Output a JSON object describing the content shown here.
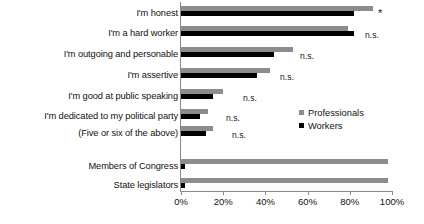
{
  "chart_data": {
    "type": "bar",
    "orientation": "horizontal",
    "title": "",
    "xlabel": "",
    "ylabel": "",
    "xlim": [
      0,
      100
    ],
    "xticks": [
      "0%",
      "20%",
      "40%",
      "60%",
      "80%",
      "100%"
    ],
    "xtick_values": [
      0,
      20,
      40,
      60,
      80,
      100
    ],
    "grid": false,
    "legend_position": "center-right",
    "categories": [
      "I'm honest",
      "I'm a hard worker",
      "I'm outgoing and personable",
      "I'm assertive",
      "I'm good at public speaking",
      "I'm dedicated to my political party",
      "(Five or six of the above)",
      "Members of Congress",
      "State legislators"
    ],
    "series": [
      {
        "name": "Professionals",
        "color": "#8c8c8c",
        "values": [
          91,
          79,
          53,
          42,
          20,
          13,
          15,
          98,
          98
        ]
      },
      {
        "name": "Workers",
        "color": "#000000",
        "values": [
          82,
          82,
          44,
          36,
          15,
          9,
          12,
          2,
          2
        ]
      }
    ],
    "annotations": [
      "*",
      "n.s.",
      "n.s.",
      "n.s.",
      "n.s.",
      "n.s.",
      "n.s.",
      "",
      ""
    ]
  },
  "legend": {
    "items": [
      {
        "label": "Professionals",
        "color": "#8c8c8c"
      },
      {
        "label": "Workers",
        "color": "#000000"
      }
    ]
  }
}
